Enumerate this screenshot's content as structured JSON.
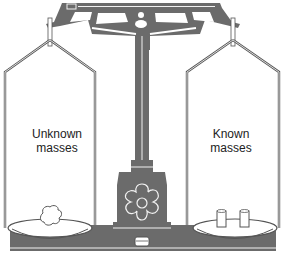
{
  "diagram": {
    "type": "equal-arm balance",
    "labels": {
      "left_line1": "Unknown",
      "left_line2": "masses",
      "right_line1": "Known",
      "right_line2": "masses"
    },
    "colors": {
      "metal": "#6b6b6b",
      "outline": "#555555",
      "highlight": "#f2f2f2",
      "background": "#ffffff",
      "label": "#222222"
    }
  }
}
